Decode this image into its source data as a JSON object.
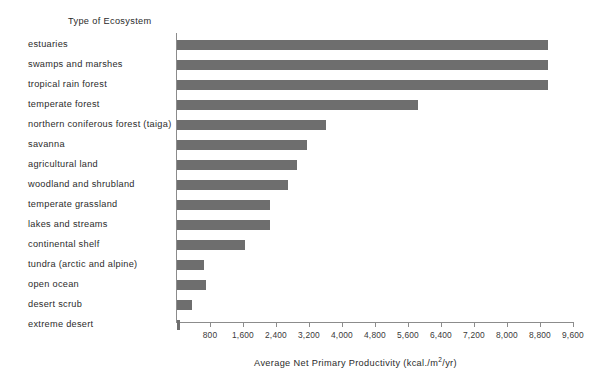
{
  "chart_data": {
    "type": "bar",
    "orientation": "horizontal",
    "title": "",
    "ylabel": "Type of Ecosystem",
    "xlabel": "Average Net Primary Productivity (kcal./m²/yr)",
    "xlabel_parts": {
      "main": "Average Net Primary Productivity (kcal./m",
      "sup": "2",
      "tail": "/yr)"
    },
    "categories": [
      "estuaries",
      "swamps and marshes",
      "tropical rain forest",
      "temperate forest",
      "northern coniferous forest (taiga)",
      "savanna",
      "agricultural land",
      "woodland and shrubland",
      "temperate grassland",
      "lakes and streams",
      "continental shelf",
      "tundra (arctic and alpine)",
      "open ocean",
      "desert scrub",
      "extreme desert"
    ],
    "values": [
      9000,
      9000,
      9000,
      5850,
      3600,
      3150,
      2900,
      2700,
      2250,
      2250,
      1650,
      650,
      700,
      375,
      70
    ],
    "xlim": [
      0,
      9600
    ],
    "xticks": [
      800,
      1600,
      2400,
      3200,
      4000,
      4800,
      5600,
      6400,
      7200,
      8000,
      8800,
      9600
    ],
    "xtick_labels": [
      "800",
      "1,600",
      "2,400",
      "3,200",
      "4,000",
      "4,800",
      "5,600",
      "6,400",
      "7,200",
      "8,000",
      "8,800",
      "9,600"
    ],
    "grid": false,
    "legend": null,
    "bar_color": "#6e6e6e",
    "axis_color": "#8c8c8c",
    "background_color": "#ffffff"
  },
  "layout": {
    "plot_left_px": 177,
    "plot_right_px": 573,
    "first_row_top_px": 36,
    "row_pitch_px": 20,
    "bar_height_px": 10
  }
}
